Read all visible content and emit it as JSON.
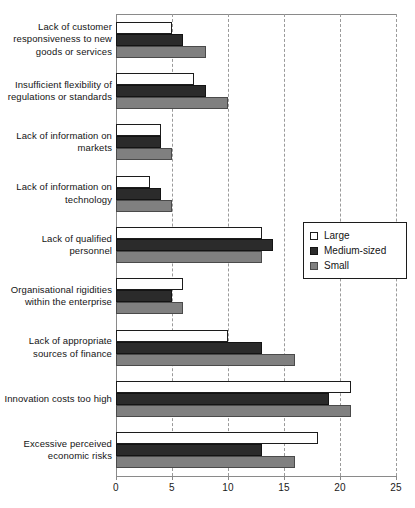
{
  "chart_data": {
    "type": "bar",
    "orientation": "horizontal",
    "title": "",
    "subtitle": "",
    "xlabel": "",
    "ylabel": "",
    "xlim": [
      0,
      25
    ],
    "xticks": [
      0,
      5,
      10,
      15,
      20,
      25
    ],
    "xtick_labels": [
      "0",
      "5",
      "10",
      "15",
      "20",
      "25"
    ],
    "grid": true,
    "grid_axis": "x",
    "grid_style": "dashed",
    "legend_position": "right-middle",
    "categories": [
      "Lack of customer responsiveness to new goods or services",
      "Insufficient flexibility of regulations or standards",
      "Lack of information on markets",
      "Lack of information on technology",
      "Lack of qualified personnel",
      "Organisational rigidities within the enterprise",
      "Lack of appropriate sources of finance",
      "Innovation costs too high",
      "Excessive perceived economic risks"
    ],
    "series": [
      {
        "name": "Large",
        "color": "#ffffff",
        "values": [
          5,
          7,
          4,
          3,
          13,
          6,
          10,
          21,
          18
        ]
      },
      {
        "name": "Medium-sized",
        "color": "#2b2b2b",
        "values": [
          6,
          8,
          4,
          4,
          14,
          5,
          13,
          19,
          13
        ]
      },
      {
        "name": "Small",
        "color": "#808080",
        "values": [
          8,
          10,
          5,
          5,
          13,
          6,
          16,
          21,
          16
        ]
      }
    ]
  },
  "legend": {
    "items": [
      {
        "label": "Large",
        "swatch": "large"
      },
      {
        "label": "Medium-sized",
        "swatch": "medium"
      },
      {
        "label": "Small",
        "swatch": "small"
      }
    ]
  },
  "colors": {
    "large": "#ffffff",
    "medium": "#2b2b2b",
    "small": "#808080",
    "axis": "#8a8a8a",
    "grid": "#9a9a9a",
    "text": "#141414",
    "background": "#ffffff"
  }
}
